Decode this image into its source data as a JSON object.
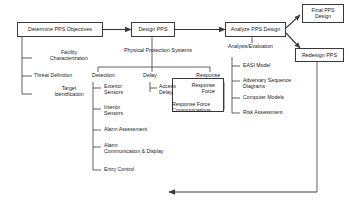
{
  "diagram": {
    "title_nodes": {
      "determine": "Determine PPS Objectives",
      "design": "Design PPS",
      "analyze": "Analyze PPS Design",
      "final": "Final PPS\nDesign",
      "redesign": "Redesign PPS"
    },
    "objectives": {
      "items": [
        "Facility\nCharacterization",
        "Threat Definition",
        "Target\nIdentification"
      ]
    },
    "design_branch": {
      "caption": "Physical Protection Systems",
      "columns": [
        {
          "header": "Detection"
        },
        {
          "header": "Delay"
        },
        {
          "header": "Response"
        }
      ],
      "detection_items": [
        "Exterior\nSensors",
        "Interior\nSensors",
        "Alarm Assessment",
        "Alarm\nCommunication & Display",
        "Entry Control"
      ],
      "delay_items": [
        "Access\nDelay"
      ],
      "response_items": [
        "Response\nForce",
        "Response Force\nCommunications"
      ]
    },
    "analysis_branch": {
      "caption": "Analysis/Evaluation",
      "items": [
        "EASI Model",
        "Adversary Sequence\nDiagrams",
        "Computer Models",
        "Risk Assessment"
      ]
    },
    "colors": {
      "line": "#3a3a3a",
      "text": "#1a1a1a",
      "background": "#ffffff"
    }
  }
}
